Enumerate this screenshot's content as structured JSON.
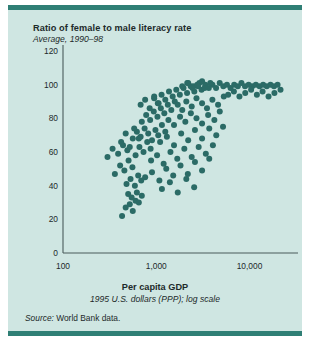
{
  "figure": {
    "background_color": "#cfe6e2",
    "rule_color": "#2f7f75",
    "marker_color": "#2b6b66",
    "axis_color": "#4a5a5a",
    "source_prefix": "Source:",
    "source_text": " World Bank data."
  },
  "chart_data": {
    "type": "scatter",
    "title": "Ratio of female to male literacy rate",
    "subtitle": "Average, 1990–98",
    "xlabel": "Per capita GDP",
    "xsublabel": "1995 U.S. dollars (PPP); log scale",
    "ylabel": "",
    "xscale": "log",
    "xlim": [
      100,
      30000
    ],
    "ylim": [
      0,
      120
    ],
    "grid": false,
    "legend": null,
    "xticks": [
      100,
      1000,
      10000
    ],
    "xticklabels": [
      "100",
      "1,000",
      "10,000"
    ],
    "yticks": [
      0,
      20,
      40,
      60,
      80,
      100,
      120
    ],
    "yticklabels": [
      "0",
      "20",
      "40",
      "60",
      "80",
      "100",
      "120"
    ],
    "marker_size": 3.0,
    "points": [
      [
        430,
        22
      ],
      [
        470,
        27
      ],
      [
        520,
        29
      ],
      [
        560,
        25
      ],
      [
        600,
        31
      ],
      [
        500,
        35
      ],
      [
        545,
        33
      ],
      [
        620,
        36
      ],
      [
        650,
        30
      ],
      [
        700,
        34
      ],
      [
        480,
        41
      ],
      [
        530,
        44
      ],
      [
        590,
        40
      ],
      [
        640,
        46
      ],
      [
        690,
        43
      ],
      [
        360,
        47
      ],
      [
        410,
        52
      ],
      [
        455,
        49
      ],
      [
        505,
        55
      ],
      [
        555,
        51
      ],
      [
        300,
        57
      ],
      [
        340,
        62
      ],
      [
        390,
        59
      ],
      [
        440,
        64
      ],
      [
        490,
        61
      ],
      [
        600,
        58
      ],
      [
        660,
        63
      ],
      [
        730,
        60
      ],
      [
        800,
        66
      ],
      [
        870,
        62
      ],
      [
        560,
        68
      ],
      [
        620,
        72
      ],
      [
        680,
        69
      ],
      [
        750,
        74
      ],
      [
        820,
        71
      ],
      [
        900,
        67
      ],
      [
        980,
        73
      ],
      [
        1050,
        70
      ],
      [
        1150,
        76
      ],
      [
        1250,
        72
      ],
      [
        700,
        78
      ],
      [
        780,
        82
      ],
      [
        860,
        79
      ],
      [
        940,
        84
      ],
      [
        1030,
        81
      ],
      [
        1120,
        86
      ],
      [
        1220,
        83
      ],
      [
        1330,
        88
      ],
      [
        1450,
        85
      ],
      [
        1580,
        90
      ],
      [
        950,
        92
      ],
      [
        1040,
        89
      ],
      [
        1140,
        94
      ],
      [
        1250,
        91
      ],
      [
        1370,
        96
      ],
      [
        1500,
        93
      ],
      [
        1640,
        97
      ],
      [
        1790,
        94
      ],
      [
        1960,
        98
      ],
      [
        2140,
        95
      ],
      [
        2340,
        99
      ],
      [
        2560,
        96
      ],
      [
        2800,
        99
      ],
      [
        3060,
        97
      ],
      [
        3350,
        100
      ],
      [
        3660,
        98
      ],
      [
        4000,
        100
      ],
      [
        4380,
        98
      ],
      [
        4790,
        101
      ],
      [
        5240,
        99
      ],
      [
        5730,
        100
      ],
      [
        6260,
        98
      ],
      [
        6850,
        100
      ],
      [
        7490,
        99
      ],
      [
        8190,
        101
      ],
      [
        8950,
        99
      ],
      [
        9790,
        100
      ],
      [
        10700,
        99
      ],
      [
        11700,
        100
      ],
      [
        12800,
        99
      ],
      [
        14000,
        100
      ],
      [
        15300,
        99
      ],
      [
        16800,
        100
      ],
      [
        18300,
        99
      ],
      [
        20000,
        100
      ],
      [
        2200,
        101
      ],
      [
        2500,
        99
      ],
      [
        2900,
        101
      ],
      [
        3300,
        98
      ],
      [
        3800,
        101
      ],
      [
        1700,
        88
      ],
      [
        1900,
        85
      ],
      [
        2100,
        90
      ],
      [
        2400,
        87
      ],
      [
        2700,
        92
      ],
      [
        3100,
        89
      ],
      [
        3500,
        86
      ],
      [
        4000,
        91
      ],
      [
        4600,
        88
      ],
      [
        5300,
        93
      ],
      [
        1350,
        79
      ],
      [
        1550,
        76
      ],
      [
        1800,
        81
      ],
      [
        2050,
        78
      ],
      [
        2350,
        83
      ],
      [
        2700,
        80
      ],
      [
        3100,
        77
      ],
      [
        3600,
        82
      ],
      [
        4200,
        79
      ],
      [
        4800,
        84
      ],
      [
        1100,
        66
      ],
      [
        1300,
        69
      ],
      [
        1550,
        64
      ],
      [
        1850,
        71
      ],
      [
        2200,
        67
      ],
      [
        2600,
        73
      ],
      [
        3100,
        68
      ],
      [
        3700,
        74
      ],
      [
        4400,
        70
      ],
      [
        5200,
        75
      ],
      [
        880,
        55
      ],
      [
        1020,
        58
      ],
      [
        1200,
        53
      ],
      [
        1420,
        60
      ],
      [
        1680,
        56
      ],
      [
        2000,
        62
      ],
      [
        2400,
        57
      ],
      [
        2850,
        63
      ],
      [
        3400,
        59
      ],
      [
        4050,
        64
      ],
      [
        760,
        45
      ],
      [
        900,
        48
      ],
      [
        1080,
        43
      ],
      [
        1280,
        50
      ],
      [
        1520,
        46
      ],
      [
        1820,
        52
      ],
      [
        2180,
        47
      ],
      [
        2600,
        54
      ],
      [
        3100,
        49
      ],
      [
        3700,
        56
      ],
      [
        1150,
        38
      ],
      [
        1400,
        42
      ],
      [
        1700,
        36
      ],
      [
        2100,
        44
      ],
      [
        2550,
        39
      ],
      [
        5900,
        94
      ],
      [
        6800,
        96
      ],
      [
        7800,
        93
      ],
      [
        9000,
        95
      ],
      [
        10400,
        97
      ],
      [
        12000,
        94
      ],
      [
        13800,
        96
      ],
      [
        16000,
        93
      ],
      [
        18500,
        95
      ],
      [
        21500,
        97
      ],
      [
        680,
        88
      ],
      [
        760,
        91
      ],
      [
        850,
        86
      ],
      [
        950,
        93
      ],
      [
        1060,
        89
      ],
      [
        420,
        66
      ],
      [
        470,
        71
      ],
      [
        520,
        63
      ],
      [
        580,
        74
      ],
      [
        650,
        68
      ],
      [
        1900,
        99
      ],
      [
        2150,
        101
      ],
      [
        2450,
        98
      ],
      [
        2750,
        100
      ],
      [
        3100,
        102
      ]
    ]
  }
}
